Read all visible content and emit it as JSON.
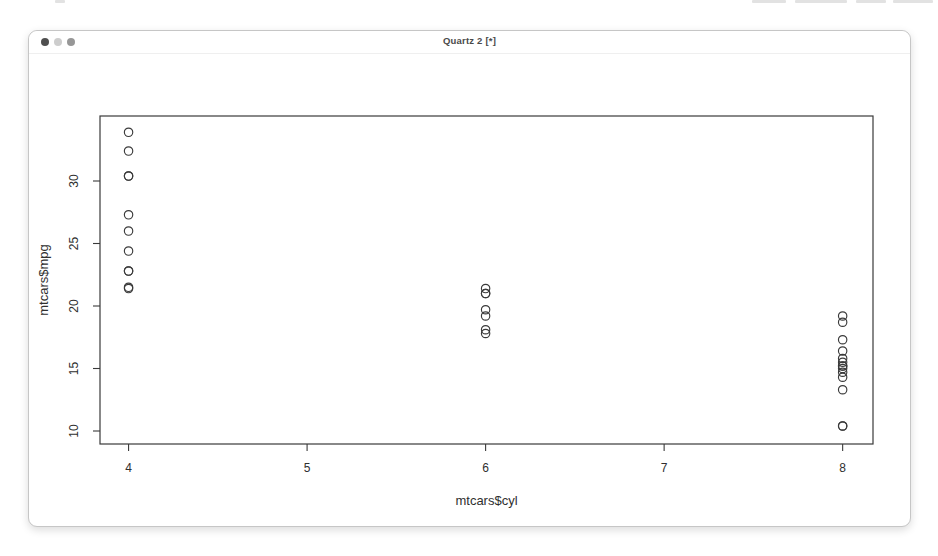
{
  "window": {
    "title": "Quartz 2 [*]",
    "traffic_lights": [
      {
        "name": "close",
        "color": "#4f4f4f"
      },
      {
        "name": "minimize",
        "color": "#cdcdcd"
      },
      {
        "name": "zoom",
        "color": "#979797"
      }
    ]
  },
  "chart_data": {
    "type": "scatter",
    "title": "",
    "xlabel": "mtcars$cyl",
    "ylabel": "mtcars$mpg",
    "x_ticks": [
      4,
      5,
      6,
      7,
      8
    ],
    "y_ticks": [
      10,
      15,
      20,
      25,
      30
    ],
    "xlim": [
      3.84,
      8.17
    ],
    "ylim": [
      8.96,
      35.2
    ],
    "grid": false,
    "legend": null,
    "marker": "open-circle",
    "marker_color": "#3a3a3a",
    "axis_color": "#3a3a3a",
    "points": [
      [
        6,
        21.0
      ],
      [
        6,
        21.0
      ],
      [
        4,
        22.8
      ],
      [
        6,
        21.4
      ],
      [
        8,
        18.7
      ],
      [
        6,
        18.1
      ],
      [
        8,
        14.3
      ],
      [
        4,
        24.4
      ],
      [
        4,
        22.8
      ],
      [
        6,
        19.2
      ],
      [
        6,
        17.8
      ],
      [
        8,
        16.4
      ],
      [
        8,
        17.3
      ],
      [
        8,
        15.2
      ],
      [
        8,
        10.4
      ],
      [
        8,
        10.4
      ],
      [
        8,
        14.7
      ],
      [
        4,
        32.4
      ],
      [
        4,
        30.4
      ],
      [
        4,
        33.9
      ],
      [
        4,
        21.5
      ],
      [
        8,
        15.5
      ],
      [
        8,
        15.2
      ],
      [
        8,
        13.3
      ],
      [
        8,
        19.2
      ],
      [
        4,
        27.3
      ],
      [
        4,
        26.0
      ],
      [
        4,
        30.4
      ],
      [
        8,
        15.8
      ],
      [
        6,
        19.7
      ],
      [
        8,
        15.0
      ],
      [
        4,
        21.4
      ]
    ]
  }
}
